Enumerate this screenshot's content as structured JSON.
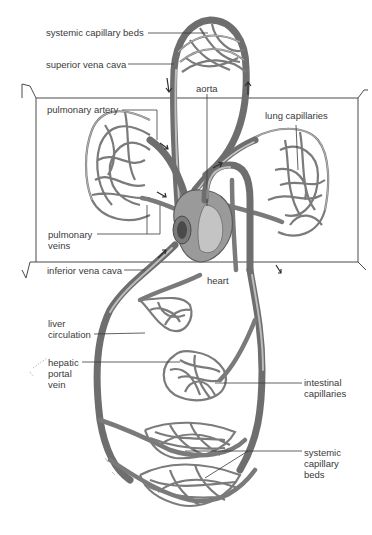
{
  "figure": {
    "labels": {
      "systemic_capillary_beds_top": "systemic capillary beds",
      "superior_vena_cava": "superior vena cava",
      "aorta": "aorta",
      "pulmonary_artery": "pulmonary artery",
      "lung_capillaries": "lung capillaries",
      "pulmonary_veins": "pulmonary veins",
      "inferior_vena_cava": "inferior vena cava",
      "heart": "heart",
      "liver_circulation": "liver circulation",
      "hepatic_portal_vein": "hepatic portal vein",
      "intestinal_capillaries": "intestinal capillaries",
      "systemic_capillary_beds_bottom": "systemic capillary beds"
    },
    "colors": {
      "background": "#ffffff",
      "vessel": "#6e6e6e",
      "label_text": "#3a3a3a"
    }
  }
}
